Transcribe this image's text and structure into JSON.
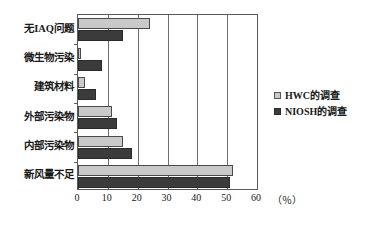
{
  "chart_data": {
    "type": "bar",
    "orientation": "horizontal",
    "title": "",
    "xlabel": "（％）",
    "ylabel": "",
    "xlim": [
      0,
      60
    ],
    "xticks": [
      0,
      10,
      20,
      30,
      40,
      50,
      60
    ],
    "grid": true,
    "legend_position": "right",
    "categories": [
      "无IAQ问题",
      "微生物污染",
      "建筑材料",
      "外部污染物",
      "内部污染物",
      "新风量不足"
    ],
    "series": [
      {
        "name": "HWC的调查",
        "color": "#c9c9c9",
        "values": [
          24,
          1,
          2.5,
          11.5,
          15,
          52
        ]
      },
      {
        "name": "NIOSH的调查",
        "color": "#3b3b3b",
        "values": [
          15,
          8,
          6,
          13,
          18,
          51
        ]
      }
    ]
  },
  "legend": {
    "items": [
      {
        "label": "HWC的调查",
        "marker": "light-gray-square"
      },
      {
        "label": "NIOSH的调查",
        "marker": "dark-gray-square"
      }
    ]
  },
  "axis": {
    "x_unit_label": "（％）",
    "x_tick_labels": [
      "0",
      "10",
      "20",
      "30",
      "40",
      "50",
      "60"
    ]
  }
}
